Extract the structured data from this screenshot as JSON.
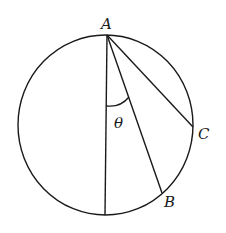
{
  "diagram": {
    "type": "circle-geometry",
    "points": {
      "A": {
        "label": "A"
      },
      "B": {
        "label": "B"
      },
      "C": {
        "label": "C"
      }
    },
    "angle_label": "θ",
    "segments": [
      "A-bottom (diameter)",
      "A-B",
      "A-C"
    ],
    "stroke_color": "#1a1a1a",
    "background": "#ffffff"
  }
}
